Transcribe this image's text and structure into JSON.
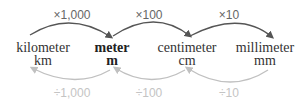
{
  "units": [
    {
      "name": "kilometer",
      "abbr": "km",
      "bold": false
    },
    {
      "name": "meter",
      "abbr": "m",
      "bold": true
    },
    {
      "name": "centimeter",
      "abbr": "cm",
      "bold": false
    },
    {
      "name": "millimeter",
      "abbr": "mm",
      "bold": false
    }
  ],
  "multiply_labels": [
    "×1,000",
    "×100",
    "×10"
  ],
  "divide_labels": [
    "÷1,000",
    "÷100",
    "÷10"
  ],
  "colors": {
    "multiply_arrow": "#555555",
    "divide_arrow": "#c0c0c0"
  }
}
